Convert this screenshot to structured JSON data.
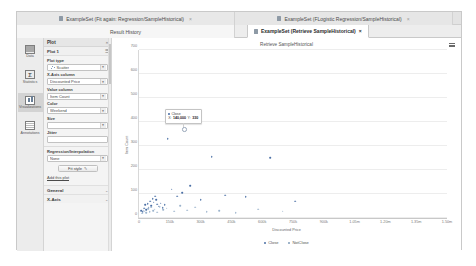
{
  "window": {
    "tabs_row1": [
      {
        "label": "ExampleSet (Fit again: Regression/SampleHistorical)",
        "icon": "table-icon",
        "close": "×"
      },
      {
        "label": "ExampleSet (FLogistic Regression/SampleHistorical)",
        "icon": "table-icon",
        "close": "×"
      }
    ],
    "tabs_row2": [
      {
        "label": "Result History",
        "icon": "history-icon",
        "active": false
      },
      {
        "label": "ExampleSet (Retrieve SampleHistorical)",
        "icon": "table-icon",
        "active": true,
        "close": "×"
      }
    ]
  },
  "rail": {
    "items": [
      {
        "label": "Data",
        "icon": "grid-icon",
        "selected": false
      },
      {
        "label": "Statistics",
        "icon": "sigma-icon",
        "selected": false
      },
      {
        "label": "Visualizations",
        "icon": "chart-icon",
        "selected": true
      },
      {
        "label": "Annotations",
        "icon": "notes-icon",
        "selected": false
      }
    ]
  },
  "panel": {
    "header": {
      "title": "Plot",
      "chevron": "×"
    },
    "plot_row": {
      "label": "Plot 1",
      "menu_icon": "list-icon"
    },
    "fields": [
      {
        "name": "plot-type",
        "label": "Plot type",
        "value": "Scatter",
        "glyph": "scatter-icon",
        "empty": false
      },
      {
        "name": "x-axis",
        "label": "X-Axis column",
        "value": "Discounted Price",
        "empty": false
      },
      {
        "name": "value",
        "label": "Value column",
        "value": "Item Count",
        "empty": false
      },
      {
        "name": "color",
        "label": "Color",
        "value": "Weekend",
        "empty": false
      },
      {
        "name": "size",
        "label": "Size",
        "value": "",
        "empty": true
      },
      {
        "name": "jitter",
        "label": "Jitter",
        "value": "",
        "empty": true
      },
      {
        "name": "regression",
        "label": "Regression/Interpolation",
        "value": "None",
        "empty": false
      }
    ],
    "fit_button": {
      "label": "Fit style",
      "icon": "brush-icon"
    },
    "add_plot_link": "Add this plot",
    "collapsed_sections": [
      {
        "label": "General",
        "chevron": "⌄"
      },
      {
        "label": "X-Axis",
        "chevron": "⌄"
      }
    ]
  },
  "chart_data": {
    "type": "scatter",
    "title": "Retrieve SampleHistorical",
    "xlabel": "Discounted Price",
    "ylabel": "Item Count",
    "xlim": [
      0,
      1500000
    ],
    "ylim": [
      0,
      700
    ],
    "grid": true,
    "legend_position": "bottom",
    "xticks": [
      {
        "value": 0,
        "label": "0"
      },
      {
        "value": 150000,
        "label": "150k"
      },
      {
        "value": 300000,
        "label": "300k"
      },
      {
        "value": 450000,
        "label": "450k"
      },
      {
        "value": 600000,
        "label": "600k"
      },
      {
        "value": 750000,
        "label": "750k"
      },
      {
        "value": 900000,
        "label": "900k"
      },
      {
        "value": 1050000,
        "label": "1.05m"
      },
      {
        "value": 1200000,
        "label": "1.20m"
      },
      {
        "value": 1350000,
        "label": "1.35m"
      },
      {
        "value": 1500000,
        "label": "1.50m"
      }
    ],
    "yticks": [
      {
        "value": 0,
        "label": "0"
      },
      {
        "value": 100,
        "label": "100"
      },
      {
        "value": 200,
        "label": "200"
      },
      {
        "value": 300,
        "label": "300"
      },
      {
        "value": 400,
        "label": "400"
      },
      {
        "value": 500,
        "label": "500"
      },
      {
        "value": 600,
        "label": "600"
      },
      {
        "value": 700,
        "label": "700"
      }
    ],
    "legend": [
      {
        "name": "Close",
        "color": "#4a6fa5"
      },
      {
        "name": "NotClose",
        "color": "#7f9db9"
      }
    ],
    "series": [
      {
        "name": "Close",
        "color": "#4a6fa5",
        "points": [
          [
            12000,
            30
          ],
          [
            18000,
            25
          ],
          [
            24000,
            40
          ],
          [
            30000,
            55
          ],
          [
            36000,
            35
          ],
          [
            42000,
            60
          ],
          [
            48000,
            45
          ],
          [
            54000,
            70
          ],
          [
            60000,
            50
          ],
          [
            66000,
            80
          ],
          [
            72000,
            65
          ],
          [
            78000,
            90
          ],
          [
            84000,
            75
          ],
          [
            90000,
            58
          ],
          [
            96000,
            48
          ],
          [
            105000,
            62
          ],
          [
            115000,
            42
          ],
          [
            125000,
            55
          ],
          [
            140000,
            330
          ],
          [
            160000,
            120
          ],
          [
            185000,
            90
          ],
          [
            210000,
            105
          ],
          [
            250000,
            135
          ],
          [
            300000,
            75
          ],
          [
            355000,
            255
          ],
          [
            420000,
            95
          ],
          [
            520000,
            88
          ],
          [
            640000,
            250
          ],
          [
            760000,
            70
          ]
        ]
      },
      {
        "name": "NotClose",
        "color": "#9bb3cc",
        "points": [
          [
            15000,
            20
          ],
          [
            22000,
            32
          ],
          [
            28000,
            28
          ],
          [
            34000,
            22
          ],
          [
            45000,
            38
          ],
          [
            52000,
            26
          ],
          [
            58000,
            44
          ],
          [
            68000,
            30
          ],
          [
            76000,
            36
          ],
          [
            88000,
            24
          ],
          [
            100000,
            46
          ],
          [
            118000,
            34
          ],
          [
            135000,
            40
          ],
          [
            170000,
            28
          ],
          [
            200000,
            50
          ],
          [
            235000,
            32
          ],
          [
            275000,
            44
          ],
          [
            330000,
            26
          ],
          [
            390000,
            30
          ],
          [
            470000,
            22
          ],
          [
            580000,
            36
          ],
          [
            700000,
            28
          ]
        ]
      }
    ],
    "tooltip": {
      "series": "Close",
      "series_color": "#4a6fa5",
      "x_label": "X:",
      "x_value": "140,000",
      "y_label": "Y:",
      "y_value": "330"
    }
  }
}
